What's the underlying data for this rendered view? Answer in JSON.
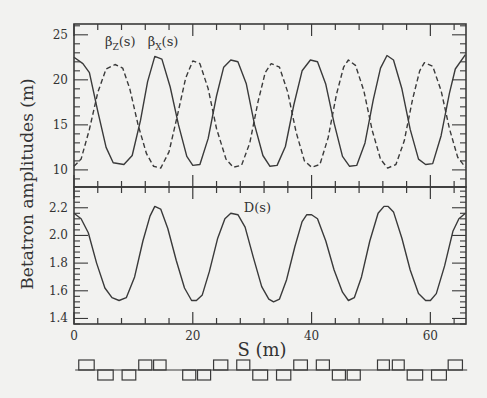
{
  "chart_data": {
    "type": "line",
    "title": "",
    "xlabel": "S (m)",
    "ylabel": "Betatron amplitudes (m)",
    "xlim": [
      0,
      66
    ],
    "x_ticks": [
      0,
      20,
      40,
      60
    ],
    "x_tick_labels": [
      "0",
      "20",
      "40",
      "60"
    ],
    "x_minor_step": 4,
    "grid": false,
    "panels": [
      {
        "name": "beta-panel",
        "ylim": [
          8.1,
          26.2
        ],
        "y_ticks": [
          10,
          15,
          20,
          25
        ],
        "y_tick_labels": [
          "10",
          "15",
          "20",
          "25"
        ],
        "y_minor_step": 1,
        "annotations": [
          {
            "text_main": "β",
            "text_sub": "Z",
            "text_tail": "(s)",
            "x": 5.2,
            "y": 24.2
          },
          {
            "text_main": "β",
            "text_sub": "X",
            "text_tail": "(s)",
            "x": 12.4,
            "y": 24.2
          }
        ],
        "series": [
          {
            "name": "βx(s)",
            "style": "solid",
            "x": [
              0,
              1.5,
              2.6,
              4.0,
              5.4,
              6.6,
              8.4,
              9.8,
              11.2,
              12.4,
              13.6,
              14.8,
              16.2,
              17.6,
              19.0,
              20.0,
              21.2,
              22.6,
              24.0,
              25.2,
              26.4,
              27.6,
              29.0,
              30.4,
              31.8,
              33.0,
              34.2,
              35.6,
              37.0,
              38.4,
              39.8,
              41.0,
              42.4,
              43.8,
              45.2,
              46.4,
              47.6,
              49.0,
              50.4,
              51.6,
              52.7,
              53.8,
              55.2,
              56.6,
              58.0,
              59.2,
              60.4,
              61.8,
              63.2,
              64.2,
              65.9
            ],
            "values": [
              22.5,
              21.8,
              20.8,
              16.5,
              12.5,
              10.8,
              10.6,
              11.6,
              15.5,
              19.8,
              22.6,
              22.3,
              19.2,
              15.0,
              11.5,
              10.5,
              10.6,
              13.5,
              18.2,
              21.4,
              22.2,
              22.0,
              19.6,
              15.0,
              11.6,
              10.4,
              10.5,
              12.6,
              17.2,
              21.0,
              22.2,
              22.0,
              19.5,
              15.2,
              11.5,
              10.4,
              10.5,
              13.0,
              17.8,
              21.3,
              22.7,
              22.2,
              19.0,
              14.5,
              11.2,
              10.6,
              10.7,
              13.8,
              18.5,
              21.2,
              22.8
            ]
          },
          {
            "name": "βz(s)",
            "style": "dashed",
            "x": [
              0,
              1.2,
              2.6,
              4.0,
              5.4,
              6.9,
              8.2,
              9.4,
              10.8,
              12.2,
              13.4,
              14.6,
              16.0,
              17.4,
              18.8,
              20.0,
              21.2,
              22.6,
              24.0,
              25.6,
              26.8,
              28.2,
              29.6,
              31.0,
              32.2,
              33.2,
              34.6,
              36.0,
              37.4,
              38.8,
              40.0,
              41.4,
              42.8,
              44.2,
              45.4,
              46.2,
              47.4,
              48.8,
              50.2,
              51.6,
              52.8,
              54.2,
              55.6,
              57.0,
              58.2,
              59.0,
              60.4,
              61.8,
              63.2,
              64.6,
              65.9
            ],
            "values": [
              10.4,
              11.2,
              14.5,
              18.6,
              21.2,
              21.7,
              21.3,
              19.0,
              15.0,
              11.8,
              10.4,
              10.2,
              12.0,
              16.0,
              20.2,
              22.1,
              21.8,
              19.0,
              14.6,
              11.2,
              10.3,
              10.5,
              13.0,
              17.6,
              20.8,
              21.8,
              21.4,
              18.6,
              14.2,
              11.0,
              10.3,
              10.6,
              13.6,
              18.4,
              21.4,
              22.2,
              21.6,
              18.8,
              14.4,
              11.2,
              10.2,
              10.6,
              13.2,
              17.8,
              21.0,
              21.9,
              21.5,
              18.8,
              14.6,
              11.4,
              10.3
            ]
          }
        ]
      },
      {
        "name": "dispersion-panel",
        "ylim": [
          1.36,
          2.35
        ],
        "y_ticks": [
          1.4,
          1.6,
          1.8,
          2.0,
          2.2
        ],
        "y_tick_labels": [
          "1.4",
          "1.6",
          "1.8",
          "2.0",
          "2.2"
        ],
        "y_minor_step": 0.04,
        "annotations": [
          {
            "text_main": "D(s)",
            "text_sub": "",
            "text_tail": "",
            "x": 28.6,
            "y": 2.2
          }
        ],
        "series": [
          {
            "name": "D(s)",
            "style": "solid",
            "x": [
              0,
              1.2,
              2.4,
              3.8,
              5.2,
              6.4,
              7.6,
              8.8,
              10.2,
              11.6,
              12.8,
              13.6,
              14.6,
              15.8,
              17.2,
              18.6,
              19.8,
              20.6,
              21.6,
              22.8,
              24.2,
              25.4,
              26.4,
              27.6,
              28.8,
              30.2,
              31.6,
              32.8,
              33.6,
              34.6,
              35.8,
              37.2,
              38.4,
              39.2,
              40.0,
              41.0,
              42.4,
              43.8,
              45.2,
              46.2,
              47.2,
              48.4,
              49.8,
              51.2,
              52.2,
              52.9,
              53.8,
              55.2,
              56.6,
              58.0,
              59.2,
              60.0,
              61.0,
              62.4,
              63.8,
              64.8,
              65.9
            ],
            "values": [
              2.16,
              2.12,
              2.02,
              1.8,
              1.62,
              1.55,
              1.53,
              1.55,
              1.7,
              1.96,
              2.14,
              2.21,
              2.19,
              2.05,
              1.82,
              1.62,
              1.53,
              1.53,
              1.57,
              1.74,
              1.98,
              2.12,
              2.16,
              2.15,
              2.06,
              1.84,
              1.63,
              1.54,
              1.52,
              1.54,
              1.68,
              1.92,
              2.1,
              2.15,
              2.15,
              2.12,
              1.96,
              1.75,
              1.59,
              1.53,
              1.55,
              1.7,
              1.96,
              2.16,
              2.21,
              2.21,
              2.17,
              1.98,
              1.75,
              1.58,
              1.53,
              1.53,
              1.58,
              1.78,
              2.03,
              2.12,
              2.16
            ]
          }
        ]
      }
    ],
    "lattice": {
      "description": "magnet layout bar (F above / D below baseline)",
      "baseline_x": [
        0.2,
        66.2
      ],
      "elements": [
        {
          "x0": 0.8,
          "x1": 3.4,
          "side": "up"
        },
        {
          "x0": 4.0,
          "x1": 6.6,
          "side": "down"
        },
        {
          "x0": 8.1,
          "x1": 10.4,
          "side": "down"
        },
        {
          "x0": 10.9,
          "x1": 13.1,
          "side": "up"
        },
        {
          "x0": 13.4,
          "x1": 15.5,
          "side": "up"
        },
        {
          "x0": 18.3,
          "x1": 20.5,
          "side": "down"
        },
        {
          "x0": 20.8,
          "x1": 23.0,
          "side": "down"
        },
        {
          "x0": 23.5,
          "x1": 25.9,
          "side": "up"
        },
        {
          "x0": 27.4,
          "x1": 29.6,
          "side": "up"
        },
        {
          "x0": 30.1,
          "x1": 32.6,
          "side": "down"
        },
        {
          "x0": 34.1,
          "x1": 36.5,
          "side": "down"
        },
        {
          "x0": 37.0,
          "x1": 39.3,
          "side": "up"
        },
        {
          "x0": 40.8,
          "x1": 43.0,
          "side": "up"
        },
        {
          "x0": 43.5,
          "x1": 45.7,
          "side": "down"
        },
        {
          "x0": 46.0,
          "x1": 48.2,
          "side": "down"
        },
        {
          "x0": 51.1,
          "x1": 53.1,
          "side": "up"
        },
        {
          "x0": 53.6,
          "x1": 55.6,
          "side": "up"
        },
        {
          "x0": 56.1,
          "x1": 58.7,
          "side": "down"
        },
        {
          "x0": 60.2,
          "x1": 62.7,
          "side": "down"
        },
        {
          "x0": 63.0,
          "x1": 65.4,
          "side": "up"
        }
      ]
    }
  },
  "colors": {
    "background": "#f2f2f0",
    "ink": "#3a3a3a"
  }
}
